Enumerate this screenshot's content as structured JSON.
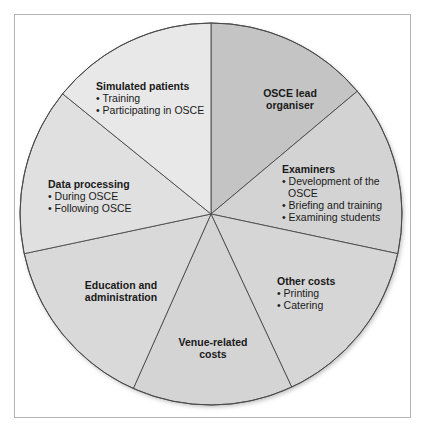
{
  "diagram": {
    "type": "pie-segment-diagram",
    "segments": [
      {
        "id": "lead",
        "title": "OSCE lead organiser",
        "title_lines": [
          "OSCE lead",
          "organiser"
        ],
        "items": [],
        "fill": "#c4c4c4",
        "start_deg": 0,
        "end_deg": 50
      },
      {
        "id": "examiners",
        "title": "Examiners",
        "items": [
          "Development of the OSCE",
          "Briefing and training",
          "Examining students"
        ],
        "item_lines": [
          "Development of the",
          "OSCE"
        ],
        "fill": "#d3d3d3",
        "start_deg": 50,
        "end_deg": 102
      },
      {
        "id": "other",
        "title": "Other costs",
        "items": [
          "Printing",
          "Catering"
        ],
        "fill": "#d6d6d6",
        "start_deg": 102,
        "end_deg": 155
      },
      {
        "id": "venue",
        "title": "Venue-related costs",
        "title_lines": [
          "Venue-related",
          "costs"
        ],
        "items": [],
        "fill": "#d4d4d4",
        "start_deg": 155,
        "end_deg": 204
      },
      {
        "id": "education",
        "title": "Education and administration",
        "title_lines": [
          "Education and",
          "administration"
        ],
        "items": [],
        "fill": "#d9d9d9",
        "start_deg": 204,
        "end_deg": 258
      },
      {
        "id": "data",
        "title": "Data processing",
        "items": [
          "During OSCE",
          "Following OSCE"
        ],
        "fill": "#e0e0e0",
        "start_deg": 258,
        "end_deg": 309
      },
      {
        "id": "simulated",
        "title": "Simulated patients",
        "items": [
          "Training",
          "Participating in OSCE"
        ],
        "fill": "#e8e8e8",
        "start_deg": 309,
        "end_deg": 360
      }
    ],
    "colors": {
      "outline": "#4a4a4a",
      "frame": "#b5b5b5",
      "text": "#1a1a1a"
    }
  }
}
